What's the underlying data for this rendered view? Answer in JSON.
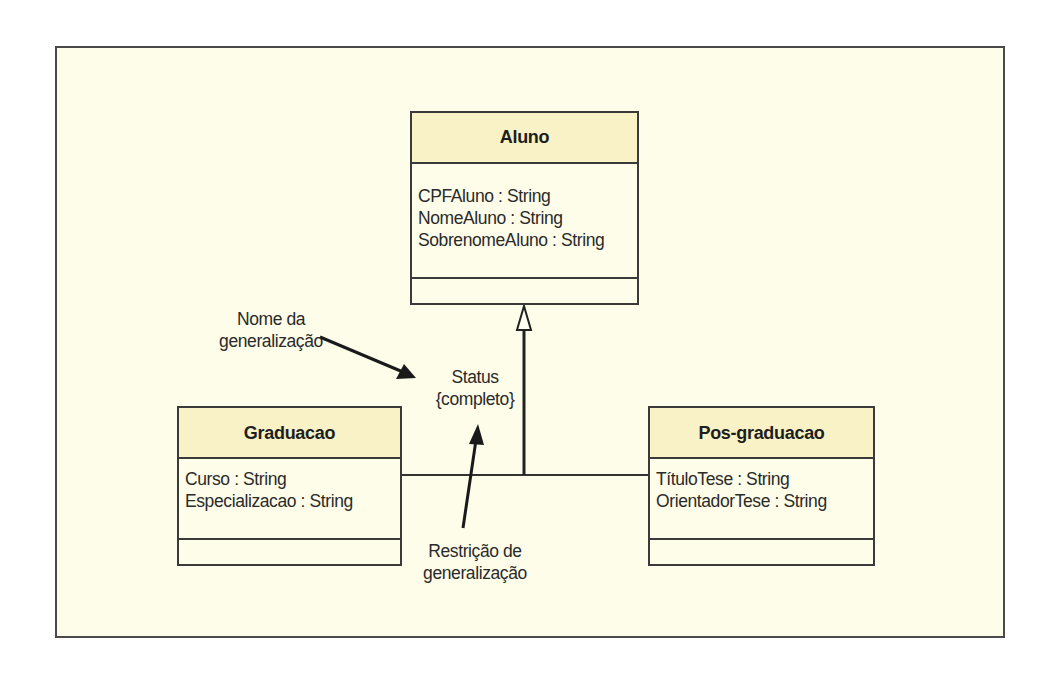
{
  "diagram": {
    "type": "UML class diagram - generalization",
    "classes": {
      "aluno": {
        "name": "Aluno",
        "attributes": [
          "CPFAluno : String",
          "NomeAluno : String",
          "SobrenomeAluno : String"
        ],
        "operations": []
      },
      "graduacao": {
        "name": "Graduacao",
        "attributes": [
          "Curso : String",
          "Especializacao : String"
        ],
        "operations": []
      },
      "pos_graduacao": {
        "name": "Pos-graduacao",
        "attributes": [
          "TítuloTese : String",
          "OrientadorTese : String"
        ],
        "operations": []
      }
    },
    "generalization": {
      "name": "Status",
      "constraint": "{completo}",
      "parent": "Aluno",
      "children": [
        "Graduacao",
        "Pos-graduacao"
      ]
    },
    "annotations": {
      "name_label": {
        "line1": "Nome da",
        "line2": "generalização"
      },
      "constraint_label": {
        "line1": "Restrição de",
        "line2": "generalização"
      }
    },
    "colors": {
      "background": "#fefde9",
      "header": "#f8f2c6",
      "border": "#3a3a3a"
    }
  }
}
